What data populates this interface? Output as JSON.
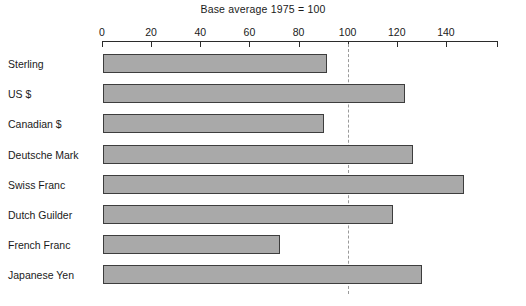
{
  "chart_data": {
    "type": "bar",
    "orientation": "horizontal",
    "title": "Base average 1975 = 100",
    "xlabel": "",
    "ylabel": "",
    "categories": [
      "Sterling",
      "US $",
      "Canadian $",
      "Deutsche Mark",
      "Swiss Franc",
      "Dutch Guilder",
      "French Franc",
      "Japanese Yen"
    ],
    "values": [
      91,
      123,
      90,
      126,
      147,
      118,
      72,
      130
    ],
    "xlim": [
      0,
      161
    ],
    "xticks": [
      0,
      20,
      40,
      60,
      80,
      100,
      120,
      140
    ],
    "xtick_labels": [
      "0",
      "20",
      "40",
      "60",
      "80",
      "100",
      "120",
      "140"
    ],
    "grid": false,
    "legend": "none",
    "reference_line": {
      "value": 100,
      "style": "dashed",
      "color": "#9a9a9a"
    },
    "bar_fill_color": "#a9a9a9",
    "bar_border_color": "#3d3d3d",
    "axis_color": "#2b2b2b",
    "background_color": "#ffffff"
  }
}
